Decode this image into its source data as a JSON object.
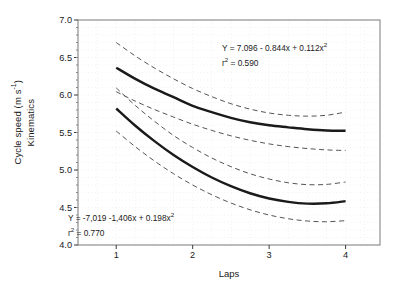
{
  "chart_data": {
    "type": "line",
    "title": "",
    "subtitle": "",
    "xlabel": "Laps",
    "ylabel": "Cycle speed (m s-1)",
    "ylabel_line1": "Cycle speed (m s",
    "ylabel_line1_sup": "-1",
    "ylabel_line1_tail": ")",
    "ylabel_line2": "Kinematics",
    "xlim": [
      0.5,
      4.45
    ],
    "ylim": [
      4.0,
      7.0
    ],
    "xticks": [
      "1",
      "2",
      "3",
      "4"
    ],
    "xtick_values": [
      1,
      2,
      3,
      4
    ],
    "yticks": [
      "4.0",
      "4.5",
      "5.0",
      "5.5",
      "6.0",
      "6.5",
      "7.0"
    ],
    "ytick_values": [
      4.0,
      4.5,
      5.0,
      5.5,
      6.0,
      6.5,
      7.0
    ],
    "grid": "dotted-faint",
    "legend": "none",
    "line_color": "#1a1a1a",
    "ci_color": "#555555",
    "frame_color": "#7a7a7a",
    "grid_color": "#e2e2e2",
    "background": "#ffffff",
    "series": [
      {
        "name": "Upper regression curve",
        "style": "solid",
        "equation": "Y = 7.096 - 0.844x + 0.112x2",
        "coefficients": {
          "a": 7.096,
          "b": -0.844,
          "c": 0.112
        },
        "r_squared": 0.59,
        "x": [
          1.0,
          1.25,
          1.5,
          1.75,
          2.0,
          2.25,
          2.5,
          2.75,
          3.0,
          3.25,
          3.5,
          3.75,
          4.0
        ],
        "values": [
          6.364,
          6.215,
          6.084,
          5.971,
          5.856,
          5.772,
          5.696,
          5.637,
          5.596,
          5.569,
          5.544,
          5.527,
          5.524
        ]
      },
      {
        "name": "Upper curve - upper 95% confidence band",
        "style": "dashed",
        "x": [
          1.0,
          1.25,
          1.5,
          1.75,
          2.0,
          2.25,
          2.5,
          2.75,
          3.0,
          3.25,
          3.5,
          3.75,
          4.0
        ],
        "values": [
          6.7,
          6.52,
          6.36,
          6.216,
          6.086,
          5.978,
          5.884,
          5.812,
          5.76,
          5.73,
          5.718,
          5.73,
          5.772
        ]
      },
      {
        "name": "Upper curve - lower 95% confidence band",
        "style": "dashed",
        "x": [
          1.0,
          1.25,
          1.5,
          1.75,
          2.0,
          2.25,
          2.5,
          2.75,
          3.0,
          3.25,
          3.5,
          3.75,
          4.0
        ],
        "values": [
          6.044,
          5.918,
          5.806,
          5.706,
          5.61,
          5.528,
          5.456,
          5.396,
          5.348,
          5.312,
          5.286,
          5.268,
          5.26
        ]
      },
      {
        "name": "Lower regression curve",
        "style": "solid",
        "equation": "Y = -7,019 - 1,406x + 0.198x2",
        "coefficients": {
          "a": -7.019,
          "b": -1.406,
          "c": 0.198
        },
        "r_squared": 0.77,
        "x": [
          1.0,
          1.25,
          1.5,
          1.75,
          2.0,
          2.25,
          2.5,
          2.75,
          3.0,
          3.25,
          3.5,
          3.75,
          4.0
        ],
        "values": [
          5.82,
          5.59,
          5.385,
          5.2,
          5.04,
          4.9,
          4.785,
          4.69,
          4.62,
          4.575,
          4.552,
          4.556,
          4.585
        ]
      },
      {
        "name": "Lower curve - upper 95% confidence band",
        "style": "dashed",
        "x": [
          1.0,
          1.25,
          1.5,
          1.75,
          2.0,
          2.25,
          2.5,
          2.75,
          3.0,
          3.25,
          3.5,
          3.75,
          4.0
        ],
        "values": [
          6.095,
          5.86,
          5.65,
          5.46,
          5.3,
          5.16,
          5.045,
          4.95,
          4.88,
          4.83,
          4.805,
          4.808,
          4.84
        ]
      },
      {
        "name": "Lower curve - lower 95% confidence band",
        "style": "dashed",
        "x": [
          1.0,
          1.25,
          1.5,
          1.75,
          2.0,
          2.25,
          2.5,
          2.75,
          3.0,
          3.25,
          3.5,
          3.75,
          4.0
        ],
        "values": [
          5.52,
          5.31,
          5.12,
          4.95,
          4.8,
          4.67,
          4.56,
          4.47,
          4.4,
          4.35,
          4.32,
          4.31,
          4.325
        ]
      }
    ]
  },
  "annotations": {
    "upper": {
      "equation_lead": "Y = 7.096 ",
      "equation_b": "- 0.844x",
      "equation_c": " + 0.112x",
      "equation_c_sup": "2",
      "r_label": "r",
      "r_sup": "2",
      "r_value": " = 0.590"
    },
    "lower": {
      "equation_lead": "Y = -7,019 ",
      "equation_b": "-1,406x",
      "equation_c": " + 0.198x",
      "equation_c_sup": "2",
      "r_label": "r",
      "r_sup": "2",
      "r_value": " = 0.770"
    }
  }
}
